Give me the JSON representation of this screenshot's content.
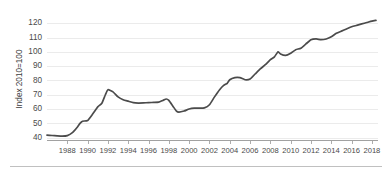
{
  "chart_data": {
    "type": "line",
    "title": "",
    "subtitle": "",
    "xlabel": "",
    "ylabel": "Index 2010=100",
    "xlim": [
      1986,
      2018.6
    ],
    "ylim": [
      38,
      124
    ],
    "grid": true,
    "legend": false,
    "legend_position": "none",
    "line_color": "#4b4b4b",
    "grid_color": "#e2e2e2",
    "axis_color": "#8a8a8a",
    "yticks": [
      40,
      50,
      60,
      70,
      80,
      90,
      100,
      110,
      120
    ],
    "ytick_labels": [
      "40",
      "50",
      "60",
      "70",
      "80",
      "90",
      "100",
      "110",
      "120"
    ],
    "xticks": [
      1988,
      1990,
      1992,
      1994,
      1996,
      1998,
      2000,
      2002,
      2004,
      2006,
      2008,
      2010,
      2012,
      2014,
      2016,
      2018
    ],
    "xtick_labels": [
      "1988",
      "1990",
      "1992",
      "1994",
      "1996",
      "1998",
      "2000",
      "2002",
      "2004",
      "2006",
      "2008",
      "2010",
      "2012",
      "2014",
      "2016",
      "2018"
    ],
    "series": [
      {
        "name": "Index 2010=100",
        "x": [
          1986.0,
          1986.5,
          1987.0,
          1987.5,
          1988.0,
          1988.5,
          1989.0,
          1989.25,
          1989.5,
          1990.0,
          1990.5,
          1991.0,
          1991.4,
          1991.75,
          1992.0,
          1992.5,
          1993.0,
          1993.5,
          1994.0,
          1994.5,
          1995.0,
          1995.5,
          1996.0,
          1996.5,
          1997.0,
          1997.4,
          1997.75,
          1998.0,
          1998.4,
          1998.75,
          1999.0,
          1999.5,
          2000.0,
          2000.5,
          2001.0,
          2001.5,
          2002.0,
          2002.5,
          2003.0,
          2003.4,
          2003.75,
          2004.0,
          2004.5,
          2005.0,
          2005.5,
          2006.0,
          2006.5,
          2007.0,
          2007.5,
          2008.0,
          2008.4,
          2008.75,
          2009.0,
          2009.5,
          2010.0,
          2010.5,
          2011.0,
          2011.5,
          2012.0,
          2012.5,
          2013.0,
          2013.5,
          2014.0,
          2014.5,
          2015.0,
          2015.5,
          2016.0,
          2016.5,
          2017.0,
          2017.5,
          2018.0,
          2018.4
        ],
        "y": [
          41.8,
          41.5,
          41.2,
          41.0,
          41.4,
          43.5,
          47.5,
          50.0,
          51.5,
          52.0,
          56.5,
          61.5,
          64.0,
          70.0,
          73.5,
          72.0,
          68.5,
          66.5,
          65.5,
          64.5,
          64.2,
          64.3,
          64.5,
          64.6,
          64.8,
          66.0,
          67.0,
          66.0,
          62.0,
          58.5,
          57.8,
          58.6,
          60.0,
          60.6,
          60.6,
          60.8,
          63.0,
          68.5,
          73.5,
          76.5,
          78.0,
          80.5,
          82.0,
          82.0,
          80.5,
          81.0,
          84.5,
          88.0,
          91.0,
          94.5,
          96.5,
          100.0,
          98.5,
          97.5,
          99.0,
          101.5,
          102.5,
          105.5,
          108.5,
          109.0,
          108.5,
          109.0,
          110.5,
          113.0,
          114.5,
          116.0,
          117.5,
          118.5,
          119.5,
          120.5,
          121.5,
          122.0
        ]
      }
    ]
  },
  "footer": {
    "rule_visible": true
  }
}
